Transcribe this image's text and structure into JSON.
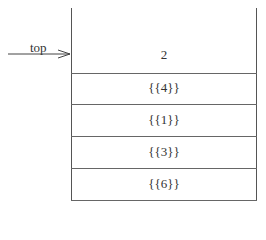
{
  "diagram": {
    "type": "stack",
    "pointer_label": "top",
    "cells": [
      {
        "value": "2"
      },
      {
        "value": "{{4}}"
      },
      {
        "value": "{{1}}"
      },
      {
        "value": "{{3}}"
      },
      {
        "value": "{{6}}"
      }
    ]
  }
}
